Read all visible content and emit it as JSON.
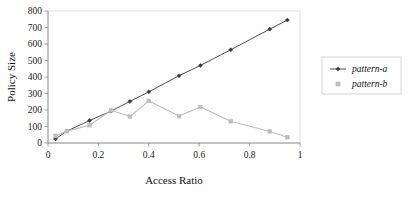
{
  "chart_data": {
    "type": "line",
    "title": "",
    "subtitle": "",
    "xlabel": "Access Ratio",
    "ylabel": "Policy Size",
    "xlim": [
      0,
      1
    ],
    "ylim": [
      0,
      800
    ],
    "xticks": [
      "0",
      "0.2",
      "0.4",
      "0.6",
      "0.8",
      "1"
    ],
    "xtick_values": [
      0,
      0.2,
      0.4,
      0.6,
      0.8,
      1
    ],
    "yticks": [
      "0",
      "100",
      "200",
      "300",
      "400",
      "500",
      "600",
      "700",
      "800"
    ],
    "ytick_values": [
      0,
      100,
      200,
      300,
      400,
      500,
      600,
      700,
      800
    ],
    "grid": false,
    "legend_position": "right-outside",
    "series": [
      {
        "name": "pattern-a",
        "color": "#3a3a3a",
        "marker": "diamond",
        "points": [
          {
            "x": 0.03,
            "y": 25
          },
          {
            "x": 0.075,
            "y": 72
          },
          {
            "x": 0.165,
            "y": 136
          },
          {
            "x": 0.25,
            "y": 193
          },
          {
            "x": 0.325,
            "y": 252
          },
          {
            "x": 0.4,
            "y": 310
          },
          {
            "x": 0.52,
            "y": 408
          },
          {
            "x": 0.605,
            "y": 470
          },
          {
            "x": 0.725,
            "y": 565
          },
          {
            "x": 0.88,
            "y": 690
          },
          {
            "x": 0.95,
            "y": 745
          }
        ]
      },
      {
        "name": "pattern-b",
        "color": "#bdbdbd",
        "marker": "square",
        "points": [
          {
            "x": 0.03,
            "y": 43
          },
          {
            "x": 0.075,
            "y": 72
          },
          {
            "x": 0.165,
            "y": 108
          },
          {
            "x": 0.25,
            "y": 198
          },
          {
            "x": 0.325,
            "y": 160
          },
          {
            "x": 0.4,
            "y": 255
          },
          {
            "x": 0.52,
            "y": 163
          },
          {
            "x": 0.605,
            "y": 218
          },
          {
            "x": 0.725,
            "y": 132
          },
          {
            "x": 0.88,
            "y": 70
          },
          {
            "x": 0.95,
            "y": 35
          }
        ]
      }
    ]
  },
  "legend": {
    "entries": [
      {
        "label": "pattern-a",
        "color": "#3a3a3a",
        "marker": "diamond-line"
      },
      {
        "label": "pattern-b",
        "color": "#bdbdbd",
        "marker": "square"
      }
    ]
  },
  "colors": {
    "series_a": "#3a3a3a",
    "series_b": "#bdbdbd",
    "axis": "#9a9a9a",
    "plot_border": "#cfcfcf",
    "text": "#111111",
    "background": "#ffffff"
  }
}
